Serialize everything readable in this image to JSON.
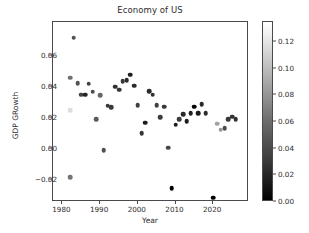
{
  "chart_data": {
    "type": "scatter",
    "title": "Economy of US",
    "xlabel": "Year",
    "ylabel": "GDP GRowth",
    "xlim": [
      1977.5,
      2029.5
    ],
    "ylim": [
      -0.034,
      0.082
    ],
    "grid": false,
    "legend": null,
    "colormap": "gray",
    "colorbar": {
      "position": "right",
      "vmin": 0.0,
      "vmax": 0.135,
      "ticks": [
        0.0,
        0.02,
        0.04,
        0.06,
        0.08,
        0.1,
        0.12
      ],
      "ticklabels": [
        "0.00",
        "0.02",
        "0.04",
        "0.06",
        "0.08",
        "0.10",
        "0.12"
      ]
    },
    "xticks": [
      1980,
      1990,
      2000,
      2010,
      2020
    ],
    "xticklabels": [
      "1980",
      "1990",
      "2000",
      "2010",
      "2020"
    ],
    "yticks": [
      -0.02,
      0.0,
      0.02,
      0.04,
      0.06
    ],
    "yticklabels": [
      "−0.02",
      "0.00",
      "0.02",
      "0.04",
      "0.06"
    ],
    "x": [
      1982,
      1982,
      1982,
      1983,
      1984,
      1985,
      1986,
      1987,
      1988,
      1989,
      1990,
      1991,
      1992,
      1993,
      1994,
      1995,
      1996,
      1997,
      1998,
      1999,
      2000,
      2001,
      2002,
      2003,
      2004,
      2005,
      2006,
      2007,
      2008,
      2009,
      2010,
      2011,
      2012,
      2013,
      2014,
      2015,
      2016,
      2017,
      2018,
      2019,
      2020,
      2021,
      2022,
      2023,
      2024,
      2025,
      2026
    ],
    "y": [
      -0.0179,
      0.0251,
      0.046,
      0.0719,
      0.0424,
      0.0352,
      0.0351,
      0.0423,
      0.037,
      0.0192,
      0.035,
      -0.0008,
      0.028,
      0.0271,
      0.0402,
      0.0383,
      0.044,
      0.0446,
      0.0481,
      0.041,
      0.0285,
      0.0103,
      0.0171,
      0.0374,
      0.0352,
      0.0285,
      0.0205,
      0.0274,
      0.001,
      -0.0251,
      0.0157,
      0.0192,
      0.0227,
      0.018,
      0.0234,
      0.0275,
      0.0232,
      0.0289,
      0.0231,
      0.0574,
      -0.0311,
      0.0164,
      0.0127,
      0.0134,
      0.0195,
      0.0211,
      0.0194
    ],
    "c": [
      0.062,
      0.1,
      0.06,
      0.043,
      0.044,
      0.036,
      0.019,
      0.036,
      0.041,
      0.048,
      0.054,
      0.042,
      0.03,
      0.03,
      0.026,
      0.028,
      0.03,
      0.023,
      0.016,
      0.022,
      0.034,
      0.028,
      0.016,
      0.023,
      0.027,
      0.034,
      0.032,
      0.029,
      0.038,
      -0.004,
      0.016,
      0.032,
      0.021,
      0.015,
      0.016,
      0.001,
      0.013,
      0.021,
      0.024,
      0.018,
      0.012,
      0.047,
      0.08,
      0.041,
      0.029,
      0.027,
      0.026
    ],
    "c_display": [
      0.062,
      0.117,
      0.06,
      0.043,
      0.044,
      0.036,
      0.019,
      0.036,
      0.041,
      0.048,
      0.054,
      0.042,
      0.03,
      0.03,
      0.026,
      0.028,
      0.03,
      0.023,
      0.016,
      0.022,
      0.034,
      0.028,
      0.016,
      0.023,
      0.027,
      0.034,
      0.032,
      0.029,
      0.038,
      0.0,
      0.016,
      0.032,
      0.021,
      0.015,
      0.016,
      0.002,
      0.013,
      0.021,
      0.024,
      0.135,
      0.0,
      0.086,
      0.08,
      0.041,
      0.029,
      0.027,
      0.026
    ]
  },
  "axis": {
    "title": "Economy of US",
    "xlabel": "Year",
    "ylabel": "GDP GRowth"
  }
}
